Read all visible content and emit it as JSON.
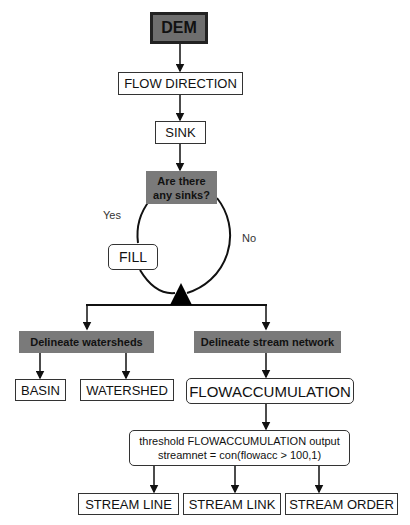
{
  "nodes": {
    "dem": "DEM",
    "flow_direction": "FLOW DIRECTION",
    "sink": "SINK",
    "decision": [
      "Are there",
      "any sinks?"
    ],
    "fill": "FILL",
    "delineate_watersheds": "Delineate watersheds",
    "delineate_stream_network": "Delineate stream network",
    "basin": "BASIN",
    "watershed": "WATERSHED",
    "flowaccumulation": "FLOWACCUMULATION",
    "threshold": [
      "threshold FLOWACCUMULATION output",
      "streamnet = con(flowacc > 100,1)"
    ],
    "stream_line": "STREAM LINE",
    "stream_link": "STREAM LINK",
    "stream_order": "STREAM ORDER"
  },
  "edge_labels": {
    "yes": "Yes",
    "no": "No"
  }
}
